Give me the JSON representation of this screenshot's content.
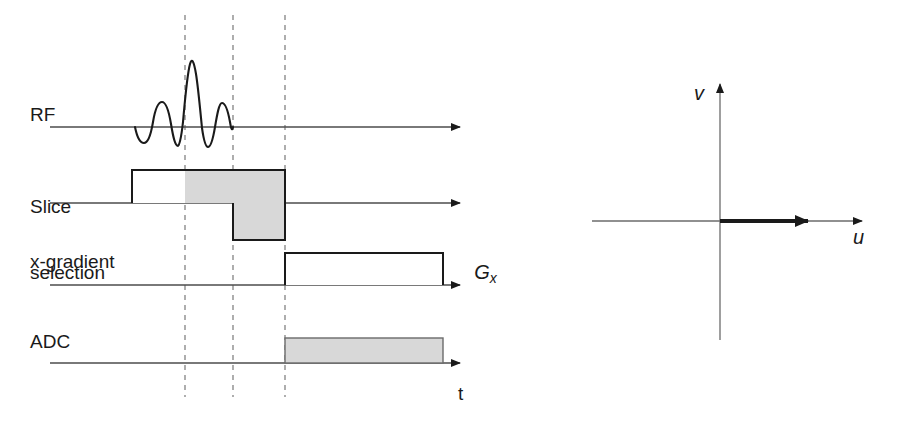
{
  "figure": {
    "background_color": "#ffffff",
    "line_color": "#1a1a1a",
    "axis_color": "#555555",
    "dashed_color": "#8c8c8c",
    "block_fill_gray": "#d8d8d8",
    "block_fill_white": "#ffffff"
  },
  "timing_diagram": {
    "channels": [
      {
        "id": "rf",
        "label": "RF",
        "baseline_y": 127
      },
      {
        "id": "slice_selection",
        "label_line1": "Slice",
        "label_line2": "selection",
        "baseline_y": 203
      },
      {
        "id": "x_gradient",
        "label": "x-gradient",
        "baseline_y": 285
      },
      {
        "id": "adc",
        "label": "ADC",
        "baseline_y": 363
      }
    ],
    "time_axis_label": "t",
    "gradient_amplitude_label": "G",
    "gradient_amplitude_subscript": "x",
    "event_markers_x": [
      185,
      233,
      285
    ],
    "events": {
      "rf_pulse": {
        "type": "sinc",
        "center_x": 185,
        "start_x": 135,
        "end_x": 233,
        "peak_y": 62,
        "lobes": 3
      },
      "slice_select_positive": {
        "start_x": 132,
        "end_x": 285,
        "top_y": 170,
        "fill_split_x": 185,
        "left_fill": "white",
        "right_fill": "gray"
      },
      "slice_select_rephase": {
        "start_x": 233,
        "end_x": 285,
        "bottom_y": 240,
        "fill": "gray"
      },
      "readout_gradient": {
        "start_x": 285,
        "end_x": 443,
        "top_y": 253,
        "fill": "white"
      },
      "adc_window": {
        "start_x": 285,
        "end_x": 443,
        "top_y": 338,
        "fill": "gray"
      }
    }
  },
  "vector_plot": {
    "x_axis_label": "u",
    "y_axis_label": "v",
    "origin": {
      "x": 720,
      "y": 221
    },
    "x_axis": {
      "start_x": 592,
      "end_x": 868
    },
    "y_axis": {
      "top_y": 78,
      "bottom_y": 340
    },
    "magnetization_vector": {
      "from_x": 720,
      "to_x": 820,
      "y": 221,
      "direction": "+u",
      "emphasis": "bold"
    }
  }
}
